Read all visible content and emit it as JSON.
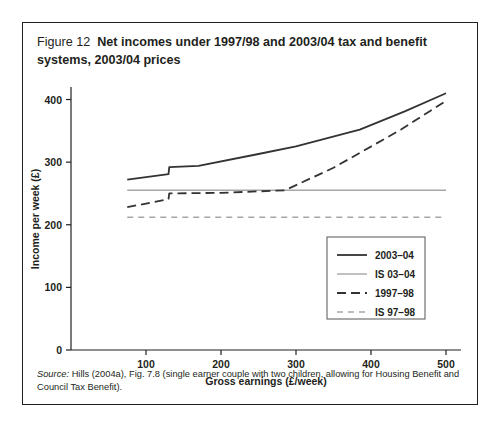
{
  "figure": {
    "label": "Figure 12",
    "title": "Net incomes under 1997/98 and 2003/04 tax and benefit systems, 2003/04 prices",
    "source_word": "Source:",
    "source_text": " Hills (2004a), Fig. 7.8 (single earner couple with two children, allowing for Housing Benefit and Council Tax Benefit)."
  },
  "colors": {
    "ink": "#231f20",
    "line_dark": "#333333",
    "line_light": "#a6a6a6",
    "border": "#231f20",
    "background": "#ffffff"
  },
  "chart_data": {
    "type": "line",
    "title": "Net incomes under 1997/98 and 2003/04 tax and benefit systems, 2003/04 prices",
    "xlabel": "Gross earnings (£/week)",
    "ylabel": "Income per week (£)",
    "xlim": [
      0,
      520
    ],
    "ylim": [
      0,
      420
    ],
    "xticks": [
      100,
      200,
      300,
      400,
      500
    ],
    "yticks": [
      0,
      100,
      200,
      300,
      400
    ],
    "xtick_labels": [
      "100",
      "200",
      "300",
      "400",
      "500"
    ],
    "ytick_labels": [
      "0",
      "100",
      "200",
      "300",
      "400"
    ],
    "grid": false,
    "legend_position": "inside-lower-right",
    "series": [
      {
        "name": "2003–04",
        "style": "solid-dark",
        "x": [
          75,
          130,
          131,
          170,
          250,
          300,
          385,
          445,
          500
        ],
        "y": [
          272,
          281,
          292,
          294,
          313,
          325,
          352,
          381,
          410
        ]
      },
      {
        "name": "IS 03–04",
        "style": "solid-light",
        "x": [
          75,
          500
        ],
        "y": [
          255,
          255
        ]
      },
      {
        "name": "1997–98",
        "style": "dashed-dark",
        "x": [
          75,
          130,
          131,
          200,
          285,
          350,
          440,
          500
        ],
        "y": [
          228,
          241,
          250,
          251,
          255,
          291,
          352,
          398
        ]
      },
      {
        "name": "IS 97–98",
        "style": "dashed-light",
        "x": [
          75,
          500
        ],
        "y": [
          212,
          212
        ]
      }
    ]
  },
  "legend": {
    "items": [
      {
        "label": "2003–04",
        "style": "solid-dark"
      },
      {
        "label": "IS 03–04",
        "style": "solid-light"
      },
      {
        "label": "1997–98",
        "style": "dashed-dark"
      },
      {
        "label": "IS 97–98",
        "style": "dashed-light"
      }
    ]
  }
}
